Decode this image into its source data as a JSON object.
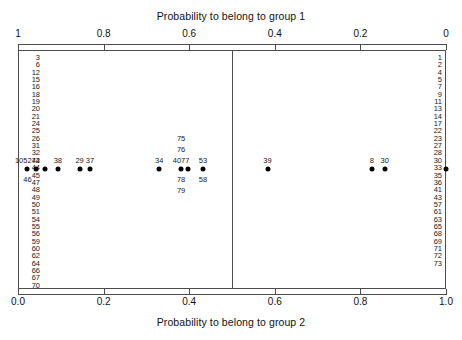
{
  "chart_data": {
    "type": "scatter",
    "title": "",
    "xlabel": "Probability to belong to group 2",
    "xlabel_top": "Probability to belong to group 1",
    "xlim": [
      0.0,
      1.0
    ],
    "ylim": [
      0,
      1
    ],
    "grid": false,
    "legend": "none",
    "decision_boundary": 0.5,
    "top_axis": {
      "label": "Probability to belong to group 1",
      "ticks": [
        {
          "value": 0.0,
          "label": "1"
        },
        {
          "value": 0.2,
          "label": "0.8"
        },
        {
          "value": 0.4,
          "label": "0.6"
        },
        {
          "value": 0.6,
          "label": "0.4"
        },
        {
          "value": 0.8,
          "label": "0.2"
        },
        {
          "value": 1.0,
          "label": "0"
        }
      ]
    },
    "bottom_axis": {
      "label": "Probability to belong to group 2",
      "ticks": [
        {
          "value": 0.0,
          "label": "0.0"
        },
        {
          "value": 0.2,
          "label": "0.2"
        },
        {
          "value": 0.4,
          "label": "0.4"
        },
        {
          "value": 0.6,
          "label": "0.6"
        },
        {
          "value": 0.8,
          "label": "0.8"
        },
        {
          "value": 1.0,
          "label": "1.0"
        }
      ]
    },
    "points": [
      {
        "x": 0.022,
        "labels_above": [
          "105274"
        ],
        "labels_below": [
          "46"
        ]
      },
      {
        "x": 0.043,
        "labels_above": [],
        "labels_below": []
      },
      {
        "x": 0.062,
        "labels_above": [],
        "labels_below": []
      },
      {
        "x": 0.093,
        "labels_above": [
          "38"
        ],
        "labels_below": []
      },
      {
        "x": 0.144,
        "labels_above": [
          "29"
        ],
        "labels_below": []
      },
      {
        "x": 0.168,
        "labels_above": [
          "37"
        ],
        "labels_below": []
      },
      {
        "x": 0.33,
        "labels_above": [
          "34"
        ],
        "labels_below": []
      },
      {
        "x": 0.381,
        "labels_above": [
          "4077",
          "76",
          "75"
        ],
        "labels_below": [
          "78",
          "79"
        ]
      },
      {
        "x": 0.398,
        "labels_above": [],
        "labels_below": []
      },
      {
        "x": 0.432,
        "labels_above": [
          "53"
        ],
        "labels_below": [
          "58"
        ]
      },
      {
        "x": 0.583,
        "labels_above": [
          "39"
        ],
        "labels_below": []
      },
      {
        "x": 0.827,
        "labels_above": [
          "8"
        ],
        "labels_below": []
      },
      {
        "x": 0.857,
        "labels_above": [
          "30"
        ],
        "labels_below": []
      },
      {
        "x": 1.0,
        "labels_above": [],
        "labels_below": []
      }
    ],
    "left_column_ids": [
      "3",
      "6",
      "12",
      "15",
      "16",
      "18",
      "19",
      "20",
      "21",
      "24",
      "25",
      "26",
      "31",
      "32",
      "42",
      "44",
      "45",
      "47",
      "48",
      "49",
      "50",
      "51",
      "54",
      "55",
      "56",
      "59",
      "60",
      "62",
      "64",
      "66",
      "67",
      "70"
    ],
    "right_column_ids": [
      "1",
      "2",
      "4",
      "5",
      "7",
      "9",
      "11",
      "13",
      "14",
      "17",
      "22",
      "23",
      "27",
      "28",
      "30",
      "33",
      "35",
      "36",
      "41",
      "43",
      "57",
      "61",
      "63",
      "65",
      "68",
      "69",
      "71",
      "72",
      "73"
    ]
  },
  "colors": {
    "axis": "#4d4d4d",
    "point": "#000000",
    "text": "#1a1a1a",
    "background": "#ffffff"
  }
}
